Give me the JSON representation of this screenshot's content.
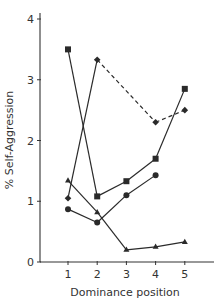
{
  "chart_data": {
    "type": "line",
    "title": "",
    "xlabel": "Dominance position",
    "ylabel": "% Self-Aggression",
    "x": [
      1,
      2,
      3,
      4,
      5
    ],
    "x_tick_labels": [
      "1",
      "2",
      "3",
      "4",
      "5"
    ],
    "y_ticks": [
      0,
      1,
      2,
      3,
      4
    ],
    "y_tick_labels": [
      "0",
      "1",
      "2",
      "3",
      "4"
    ],
    "xlim": [
      0.05,
      6.3
    ],
    "ylim": [
      0,
      4.1
    ],
    "grid": false,
    "legend": null,
    "series": [
      {
        "name": "square-series",
        "marker": "square",
        "values": [
          3.5,
          1.08,
          1.33,
          1.7,
          2.85
        ],
        "segment_styles": [
          "solid",
          "solid",
          "solid",
          "solid"
        ]
      },
      {
        "name": "diamond-series",
        "marker": "diamond",
        "values": [
          1.05,
          3.33,
          null,
          2.3,
          2.5
        ],
        "segment_styles": [
          "solid",
          "dashed",
          "dashed",
          "solid"
        ]
      },
      {
        "name": "circle-series",
        "marker": "circle",
        "values": [
          0.87,
          0.65,
          1.1,
          1.43,
          null
        ],
        "segment_styles": [
          "solid",
          "solid",
          "solid"
        ]
      },
      {
        "name": "triangle-series",
        "marker": "triangle",
        "values": [
          1.34,
          0.82,
          0.2,
          0.25,
          0.33
        ],
        "segment_styles": [
          "solid",
          "solid",
          "solid",
          "solid"
        ]
      }
    ]
  },
  "colors": {
    "line": "#2a2a2a",
    "axis": "#333333",
    "background": "#ffffff"
  }
}
